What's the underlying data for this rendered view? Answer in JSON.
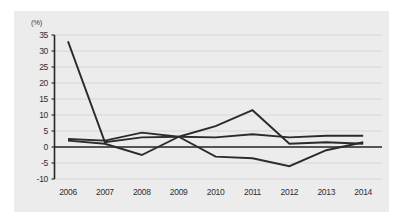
{
  "chart_data": {
    "type": "line",
    "title": "",
    "subtitle": "",
    "xlabel": "",
    "ylabel": "(%)",
    "unit_label": "(%)",
    "categories": [
      "2006",
      "2007",
      "2008",
      "2009",
      "2010",
      "2011",
      "2012",
      "2013",
      "2014"
    ],
    "x": [
      2006,
      2007,
      2008,
      2009,
      2010,
      2011,
      2012,
      2013,
      2014
    ],
    "xlim": [
      2006,
      2014
    ],
    "ylim": [
      -10,
      35
    ],
    "yticks": [
      35,
      30,
      25,
      20,
      15,
      10,
      5,
      0,
      -5,
      -10
    ],
    "ytick_labels": [
      "35",
      "30",
      "25",
      "20",
      "15",
      "10",
      "5",
      "0",
      "-5",
      "-10"
    ],
    "ytick_step": 5,
    "grid": true,
    "grid_axis": "y",
    "legend": "none",
    "zero_line": 0,
    "series": [
      {
        "name": "series-1",
        "color": "#2b2b2b",
        "values": [
          33.0,
          1.5,
          3.0,
          3.2,
          6.5,
          11.5,
          1.0,
          1.5,
          1.0
        ]
      },
      {
        "name": "series-2",
        "color": "#2b2b2b",
        "values": [
          2.5,
          2.0,
          4.5,
          3.2,
          3.0,
          4.0,
          3.0,
          3.5,
          3.5
        ]
      },
      {
        "name": "series-3",
        "color": "#2b2b2b",
        "values": [
          2.0,
          1.0,
          -2.5,
          3.2,
          -3.0,
          -3.5,
          -6.0,
          -1.0,
          1.5
        ]
      }
    ]
  },
  "axes": {
    "unit": "(%)"
  }
}
